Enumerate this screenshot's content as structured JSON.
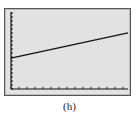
{
  "chart_data": {
    "type": "line",
    "title": "",
    "caption": "(h)",
    "xlabel": "",
    "ylabel": "",
    "grid": false,
    "axes_ticks": true,
    "series": [
      {
        "name": "line",
        "points": [
          [
            0,
            0.4
          ],
          [
            1,
            0.73
          ]
        ]
      }
    ],
    "xlim": [
      0,
      1
    ],
    "ylim": [
      0,
      1
    ]
  },
  "caption": "(h)"
}
